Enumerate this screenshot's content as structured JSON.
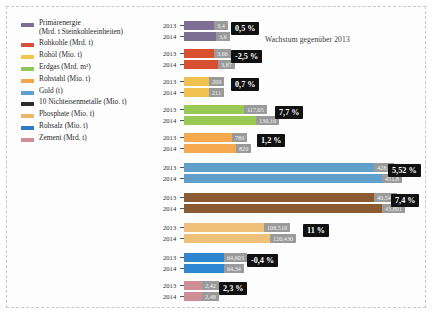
{
  "chart_title": "Wachstum gegenüber 2013",
  "legend": [
    {
      "label": "Primärenergie\n(Mrd. t Steinkohleeinheiten)",
      "color": "#7d6f93"
    },
    {
      "label": "Rohkohle (Mrd. t)",
      "color": "#d94f3d"
    },
    {
      "label": "Rohöl (Mio. t)",
      "color": "#f0c64e"
    },
    {
      "label": "Erdgas (Mrd. m³)",
      "color": "#8fc75a"
    },
    {
      "label": "Rohstahl (Mio. t)",
      "color": "#f2a54a"
    },
    {
      "label": "Gold (t)",
      "color": "#5f9fc9"
    },
    {
      "label": "10 Nichteisenmetalle (Mio. t)",
      "color": "#2b2b2b"
    },
    {
      "label": "Phosphate (Mio. t)",
      "color": "#e8b96c"
    },
    {
      "label": "Rohsalz (Mio. t)",
      "color": "#2e78bf"
    },
    {
      "label": "Zement (Mrd. t)",
      "color": "#cf8d95"
    }
  ],
  "year_labels": {
    "y2013": "2013",
    "y2014": "2014"
  },
  "chart_data": {
    "type": "bar",
    "title": "Wachstum gegenüber 2013",
    "xlabel": "",
    "ylabel": "",
    "orientation": "horizontal",
    "series": [
      {
        "name": "2013",
        "values": [
          3.4,
          3.66,
          209,
          117.05,
          780,
          428.3,
          40.549,
          108.51,
          64.603,
          2.42
        ]
      },
      {
        "name": "2014",
        "values": [
          3.6,
          3.87,
          211,
          130.16,
          820,
          451.8,
          43.801,
          120.43,
          64.34,
          2.48
        ]
      }
    ],
    "categories": [
      "Primärenergie",
      "Rohkohle",
      "Rohöl",
      "Erdgas",
      "Rohstahl",
      "Gold",
      "10 Nichteisenmetalle",
      "Phosphate",
      "Rohsalz",
      "Zement"
    ],
    "groups": [
      {
        "category": "Primärenergie",
        "color": "#7d6f93",
        "v2013": "3,4",
        "v2014": "3,6",
        "w2013": 30,
        "w2014": 32,
        "growth": "0,5 %",
        "growth_left": 68,
        "growth_top": 1
      },
      {
        "category": "Rohkohle",
        "color": "#d8502f",
        "v2013": "3,66",
        "v2014": "3,87",
        "w2013": 30,
        "w2014": 34,
        "growth": "-2,5 %",
        "growth_left": 68,
        "growth_top": 1
      },
      {
        "category": "Rohöl",
        "color": "#f0c14e",
        "v2013": "209",
        "v2014": "211",
        "w2013": 25,
        "w2014": 25,
        "growth": "0,7 %",
        "growth_left": 68,
        "growth_top": 1
      },
      {
        "category": "Erdgas",
        "color": "#97c954",
        "v2013": "117,05",
        "v2014": "130,16",
        "w2013": 60,
        "w2014": 72,
        "growth": "7,7 %",
        "growth_left": 112,
        "growth_top": 1
      },
      {
        "category": "Rohstahl",
        "color": "#f5a94e",
        "v2013": "780",
        "v2014": "820",
        "w2013": 48,
        "w2014": 52,
        "growth": "1,2 %",
        "growth_left": 94,
        "growth_top": 1
      },
      {
        "category": "Gold",
        "color": "#5f9fc9",
        "v2013": "428,3",
        "v2014": "451,8",
        "w2013": 190,
        "w2014": 198,
        "growth": "5,52 %",
        "growth_left": 225,
        "growth_top": 1
      },
      {
        "category": "10 Nichteisenmetalle",
        "color": "#8a5a32",
        "v2013": "40,549",
        "v2014": "43,801",
        "w2013": 190,
        "w2014": 198,
        "growth": "7,4 %",
        "growth_left": 228,
        "growth_top": 1
      },
      {
        "category": "Phosphate",
        "color": "#eec07a",
        "v2013": "108,510",
        "v2014": "120,430",
        "w2013": 80,
        "w2014": 86,
        "growth": "11 %",
        "growth_left": 140,
        "growth_top": 1
      },
      {
        "category": "Rohsalz",
        "color": "#2e86d0",
        "v2013": "64,603",
        "v2014": "64,34",
        "w2013": 40,
        "w2014": 40,
        "growth": "-0,4 %",
        "growth_left": 84,
        "growth_top": 1
      },
      {
        "category": "Zement",
        "color": "#cf8d95",
        "v2013": "2,42",
        "v2014": "2,48",
        "w2013": 18,
        "w2014": 18,
        "growth": "2,3 %",
        "growth_left": 56,
        "growth_top": 1
      }
    ],
    "group_tops": [
      0,
      28,
      56,
      84,
      112,
      142,
      172,
      202,
      232,
      260
    ],
    "grid": false,
    "legend_position": "left"
  }
}
